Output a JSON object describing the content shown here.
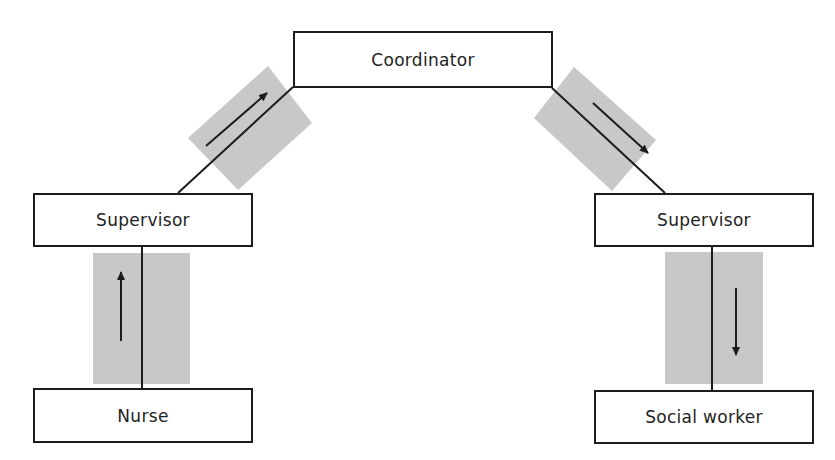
{
  "diagram": {
    "type": "communication-flow",
    "colors": {
      "stroke": "#1c1c1c",
      "channel_fill": "#c8c8c8",
      "text": "#222222",
      "background": "#ffffff"
    },
    "nodes": {
      "coordinator": {
        "label": "Coordinator"
      },
      "supervisor_left": {
        "label": "Supervisor"
      },
      "supervisor_right": {
        "label": "Supervisor"
      },
      "nurse": {
        "label": "Nurse"
      },
      "social_worker": {
        "label": "Social worker"
      }
    },
    "edges": [
      {
        "from": "Nurse",
        "to": "Supervisor (left)",
        "arrow": "up"
      },
      {
        "from": "Supervisor (left)",
        "to": "Coordinator",
        "arrow": "up-right"
      },
      {
        "from": "Coordinator",
        "to": "Supervisor (right)",
        "arrow": "down-right"
      },
      {
        "from": "Supervisor (right)",
        "to": "Social worker",
        "arrow": "down"
      }
    ]
  }
}
